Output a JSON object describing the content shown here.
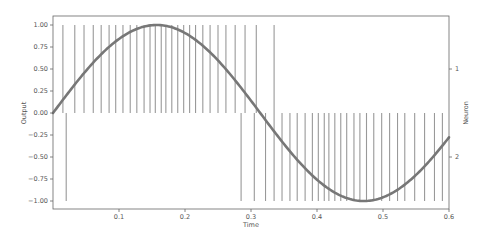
{
  "chart_data": {
    "type": "line",
    "title": "",
    "xlabel": "Time",
    "ylabel": "Output",
    "ylabel_right": "Neuron",
    "xlim": [
      0.0,
      0.6
    ],
    "ylim": [
      -1.08,
      1.08
    ],
    "grid": false,
    "legend": null,
    "x_ticks": [
      "0.1",
      "0.2",
      "0.3",
      "0.4",
      "0.5",
      "0.6"
    ],
    "x_tick_values": [
      0.1,
      0.2,
      0.3,
      0.4,
      0.5,
      0.6
    ],
    "y_ticks": [
      "1.00",
      "0.75",
      "0.50",
      "0.25",
      "0.00",
      "−0.25",
      "−0.50",
      "−0.75",
      "−1.00"
    ],
    "y_tick_values": [
      1.0,
      0.75,
      0.5,
      0.25,
      0.0,
      -0.25,
      -0.5,
      -0.75,
      -1.0
    ],
    "right_ticks": [
      "1",
      "2"
    ],
    "series": [
      {
        "name": "Output (sine)",
        "kind": "line",
        "color": "#777777",
        "function": "sin(2*pi*t/0.628 )",
        "x": [
          0.0,
          0.05,
          0.1,
          0.157,
          0.2,
          0.25,
          0.3,
          0.314,
          0.35,
          0.4,
          0.45,
          0.471,
          0.5,
          0.55,
          0.6
        ],
        "values": [
          0.0,
          0.48,
          0.84,
          1.0,
          0.91,
          0.6,
          0.14,
          0.0,
          -0.34,
          -0.76,
          -0.98,
          -1.0,
          -0.96,
          -0.71,
          -0.28
        ]
      },
      {
        "name": "Neuron 1 spikes",
        "kind": "eventplot",
        "row": 1,
        "color": "#999999",
        "times": [
          0.015,
          0.033,
          0.047,
          0.061,
          0.073,
          0.085,
          0.095,
          0.106,
          0.117,
          0.127,
          0.138,
          0.147,
          0.155,
          0.164,
          0.171,
          0.18,
          0.189,
          0.198,
          0.207,
          0.216,
          0.227,
          0.238,
          0.25,
          0.262,
          0.276,
          0.291,
          0.308,
          0.335
        ]
      },
      {
        "name": "Neuron 2 spikes",
        "kind": "eventplot",
        "row": 2,
        "color": "#999999",
        "times": [
          0.02,
          0.285,
          0.305,
          0.322,
          0.335,
          0.347,
          0.359,
          0.37,
          0.382,
          0.393,
          0.402,
          0.411,
          0.418,
          0.427,
          0.436,
          0.445,
          0.456,
          0.465,
          0.475,
          0.486,
          0.498,
          0.51,
          0.522,
          0.533,
          0.548,
          0.563,
          0.578,
          0.59
        ]
      }
    ]
  }
}
